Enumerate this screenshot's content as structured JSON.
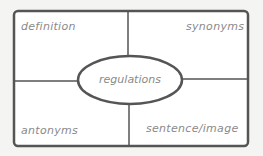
{
  "diagram": {
    "type": "frayer-model",
    "center_term": "regulations",
    "quadrants": {
      "top_left": "definition",
      "top_right": "synonyms",
      "bottom_left": "antonyms",
      "bottom_right": "sentence/image"
    },
    "colors": {
      "background": "#f4f4f3",
      "box": "#ffffff",
      "lines": "#555555",
      "text": "#8a8a8a"
    }
  }
}
